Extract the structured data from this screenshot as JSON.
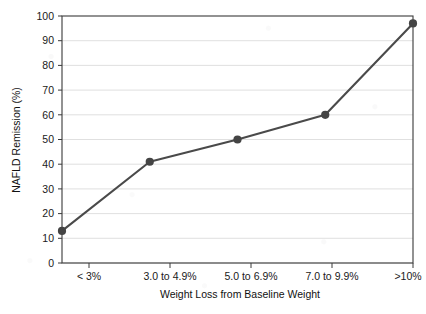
{
  "chart_data": {
    "type": "line",
    "title": "",
    "subtitle": "",
    "xlabel": "Weight Loss from Baseline Weight",
    "ylabel": "NAFLD Remission (%)",
    "categories": [
      "< 3%",
      "3.0 to 4.9%",
      "5.0 to 6.9%",
      "7.0 to 9.9%",
      ">10%"
    ],
    "values": [
      13,
      41,
      50,
      60,
      97
    ],
    "series": [
      {
        "name": "NAFLD Remission (%)",
        "values": [
          13,
          41,
          50,
          60,
          97
        ]
      }
    ],
    "ylim": [
      0,
      100
    ],
    "ytick_step": 10,
    "yticks": [
      "0",
      "10",
      "20",
      "30",
      "40",
      "50",
      "60",
      "70",
      "80",
      "90",
      "100"
    ],
    "grid": "horizontal",
    "legend": "none",
    "marker": "circle",
    "colors": {
      "line": "#4a4a4a",
      "marker": "#444444",
      "grid": "#d8d8d8",
      "axis": "#3a3a3a",
      "background": "#ffffff",
      "text": "#1a1a1a"
    }
  }
}
